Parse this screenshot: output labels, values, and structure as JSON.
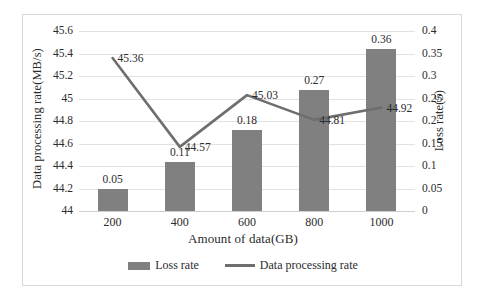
{
  "chart_data": {
    "type": "bar",
    "title": "",
    "xlabel": "Amount of data(GB)",
    "categories": [
      "200",
      "400",
      "600",
      "800",
      "1000"
    ],
    "grid": true,
    "legend_position": "bottom",
    "series": [
      {
        "name": "Loss rate",
        "type": "bar",
        "axis": "right",
        "color": "#808080",
        "values": [
          0.05,
          0.11,
          0.18,
          0.27,
          0.36
        ],
        "labels": [
          "0.05",
          "0.11",
          "0.18",
          "0.27",
          "0.36"
        ]
      },
      {
        "name": "Data processing rate",
        "type": "line",
        "axis": "left",
        "color": "#6e6e6e",
        "values": [
          45.36,
          44.57,
          45.03,
          44.81,
          44.92
        ],
        "labels": [
          "45.36",
          "44.57",
          "45.03",
          "44.81",
          "44.92"
        ]
      }
    ],
    "y_left": {
      "label": "Data processing rate(MB/s)",
      "min": 44,
      "max": 45.6,
      "step": 0.2,
      "ticks": [
        "45.6",
        "45.4",
        "45.2",
        "45",
        "44.8",
        "44.6",
        "44.4",
        "44.2",
        "44"
      ]
    },
    "y_right": {
      "label": "Loss rate(5)",
      "min": 0,
      "max": 0.4,
      "step": 0.05,
      "ticks": [
        "0.4",
        "0.35",
        "0.3",
        "0.25",
        "0.2",
        "0.15",
        "0.1",
        "0.05",
        "0"
      ]
    },
    "legend": [
      "Loss rate",
      "Data processing rate"
    ]
  }
}
